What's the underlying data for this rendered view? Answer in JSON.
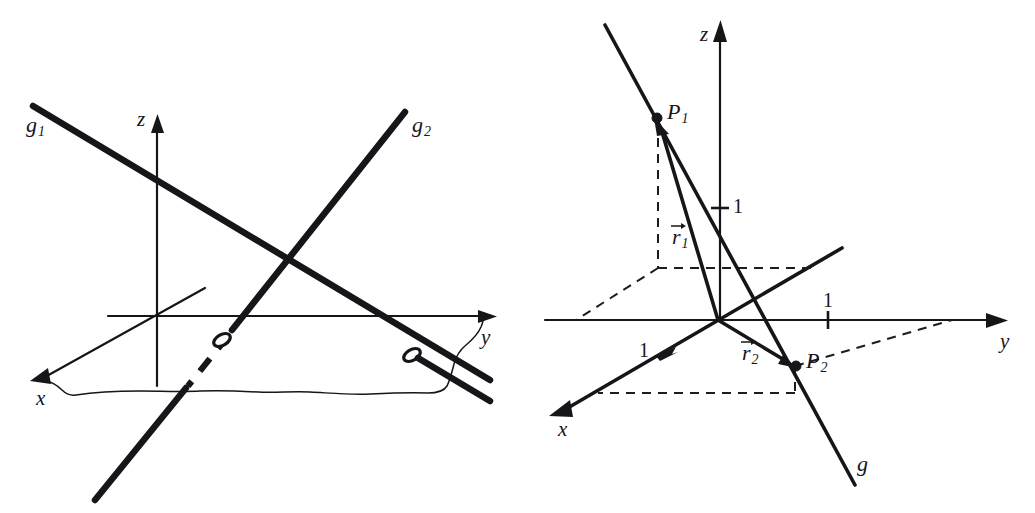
{
  "figure": {
    "type": "geometry-diagram",
    "background_color": "#ffffff",
    "ink_color": "#16161a",
    "panels": [
      {
        "id": "left",
        "name": "skew-lines-panel",
        "axes": [
          {
            "name": "x",
            "label": "x"
          },
          {
            "name": "y",
            "label": "y"
          },
          {
            "name": "z",
            "label": "z"
          }
        ],
        "lines": [
          {
            "name": "g1",
            "label": "g",
            "subscript": "1"
          },
          {
            "name": "g2",
            "label": "g",
            "subscript": "2"
          }
        ],
        "markers": [
          {
            "name": "crossing-hole-1",
            "glyph": "ellipse"
          },
          {
            "name": "crossing-hole-2",
            "glyph": "ellipse"
          }
        ]
      },
      {
        "id": "right",
        "name": "line-through-two-points-panel",
        "axes": [
          {
            "name": "x",
            "label": "x"
          },
          {
            "name": "y",
            "label": "y"
          },
          {
            "name": "z",
            "label": "z"
          }
        ],
        "lines": [
          {
            "name": "g",
            "label": "g",
            "subscript": ""
          }
        ],
        "points": [
          {
            "name": "P1",
            "label": "P",
            "subscript": "1"
          },
          {
            "name": "P2",
            "label": "P",
            "subscript": "2"
          }
        ],
        "vectors": [
          {
            "name": "r1",
            "label": "r",
            "subscript": "1",
            "accent": "arrow"
          },
          {
            "name": "r2",
            "label": "r",
            "subscript": "2",
            "accent": "arrow"
          }
        ],
        "unit_ticks": [
          {
            "name": "unit-tick-z",
            "axis": "z",
            "label": "1"
          },
          {
            "name": "unit-tick-y",
            "axis": "y",
            "label": "1"
          },
          {
            "name": "unit-tick-x",
            "axis": "x",
            "label": "1"
          }
        ]
      }
    ]
  }
}
